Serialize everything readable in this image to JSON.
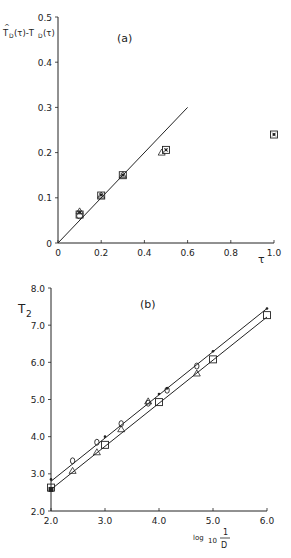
{
  "chart_data": [
    {
      "type": "scatter",
      "panel_label": "(a)",
      "title": "",
      "xlabel": "τ",
      "ylabel": "T̂D(τ)-TD(τ)",
      "xlim": [
        0,
        1.0
      ],
      "ylim": [
        0,
        0.5
      ],
      "xticks": [
        "0",
        "0.2",
        "0.4",
        "0.6",
        "0.8",
        "1.0"
      ],
      "yticks": [
        "0",
        "0.1",
        "0.2",
        "0.3",
        "0.4",
        "0.5"
      ],
      "grid": false,
      "line": {
        "x": [
          0,
          0.6
        ],
        "y": [
          0,
          0.3
        ]
      },
      "series": [
        {
          "name": "square",
          "x": [
            0.1,
            0.2,
            0.3,
            0.5,
            1.0
          ],
          "y": [
            0.063,
            0.105,
            0.15,
            0.206,
            0.24
          ]
        },
        {
          "name": "star",
          "x": [
            0.1,
            0.2,
            0.3,
            0.5,
            1.0
          ],
          "y": [
            0.068,
            0.106,
            0.15,
            0.206,
            0.24
          ]
        },
        {
          "name": "triangle",
          "x": [
            0.1,
            0.2,
            0.3,
            0.48
          ],
          "y": [
            0.07,
            0.105,
            0.15,
            0.2
          ]
        },
        {
          "name": "circle",
          "x": [
            0.1
          ],
          "y": [
            0.06
          ]
        }
      ]
    },
    {
      "type": "scatter",
      "panel_label": "(b)",
      "title": "",
      "xlabel": "log10 1/D",
      "ylabel": "T2",
      "xlim": [
        2.0,
        6.0
      ],
      "ylim": [
        2.0,
        8.0
      ],
      "xticks": [
        "2.0",
        "3.0",
        "4.0",
        "5.0",
        "6.0"
      ],
      "yticks": [
        "2.0",
        "3.0",
        "4.0",
        "5.0",
        "6.0",
        "7.0",
        "8.0"
      ],
      "grid": false,
      "lines": [
        {
          "name": "upper fit",
          "x": [
            2.0,
            6.0
          ],
          "y": [
            2.8,
            7.45
          ]
        },
        {
          "name": "lower fit",
          "x": [
            2.0,
            6.0
          ],
          "y": [
            2.58,
            7.22
          ]
        }
      ],
      "series": [
        {
          "name": "dot",
          "x": [
            2.0,
            3.0,
            4.0,
            4.15,
            5.0,
            6.0
          ],
          "y": [
            2.85,
            4.0,
            5.15,
            5.3,
            6.3,
            7.45
          ]
        },
        {
          "name": "diamond",
          "x": [
            2.4,
            2.85,
            3.3,
            3.8,
            4.15,
            4.7
          ],
          "y": [
            3.35,
            3.85,
            4.35,
            4.9,
            5.25,
            5.9
          ]
        },
        {
          "name": "triangle",
          "x": [
            2.4,
            2.85,
            3.3,
            3.8,
            4.7
          ],
          "y": [
            3.08,
            3.58,
            4.2,
            4.95,
            5.7
          ]
        },
        {
          "name": "square",
          "x": [
            2.0,
            3.0,
            4.0,
            5.0,
            6.0
          ],
          "y": [
            2.63,
            3.78,
            4.93,
            6.08,
            7.27
          ]
        },
        {
          "name": "filled",
          "x": [
            2.0
          ],
          "y": [
            2.58
          ]
        }
      ]
    }
  ],
  "labels": {
    "a_panel": "(a)",
    "a_xlabel": "τ",
    "a_ylabel_main": "T",
    "a_ylabel_expr": "(τ)-T",
    "a_ylabel_expr2": "(τ)",
    "a_ylabel_sub": "D",
    "b_panel": "(b)",
    "b_ylabel": "T",
    "b_ylabel_sub": "2",
    "b_xlabel_log": "log",
    "b_xlabel_base": "10",
    "b_xlabel_num": "1",
    "b_xlabel_den": "D"
  }
}
